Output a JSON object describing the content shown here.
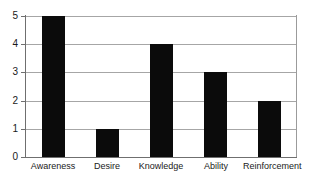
{
  "chart_data": {
    "type": "bar",
    "title": "",
    "subtitle": "",
    "xlabel": "",
    "ylabel": "",
    "categories": [
      "Awareness",
      "Desire",
      "Knowledge",
      "Ability",
      "Reinforcement"
    ],
    "values": [
      5,
      1,
      4,
      3,
      2
    ],
    "ylim": [
      0,
      5
    ],
    "xlim": null,
    "ytick_labels": [
      "0",
      "1",
      "2",
      "3",
      "4",
      "5"
    ],
    "ytick_values": [
      0,
      1,
      2,
      3,
      4,
      5
    ],
    "grid": "horizontal",
    "legend": "none",
    "annotations": [],
    "series": [
      {
        "name": "",
        "values": [
          5,
          1,
          4,
          3,
          2
        ]
      }
    ]
  },
  "style": {
    "bar_color": "#0b0b0b",
    "grid_color": "#a6a6a6",
    "axis_color": "#6f6f6f",
    "text_color": "#1a1a1a",
    "background_color": "#ffffff"
  }
}
